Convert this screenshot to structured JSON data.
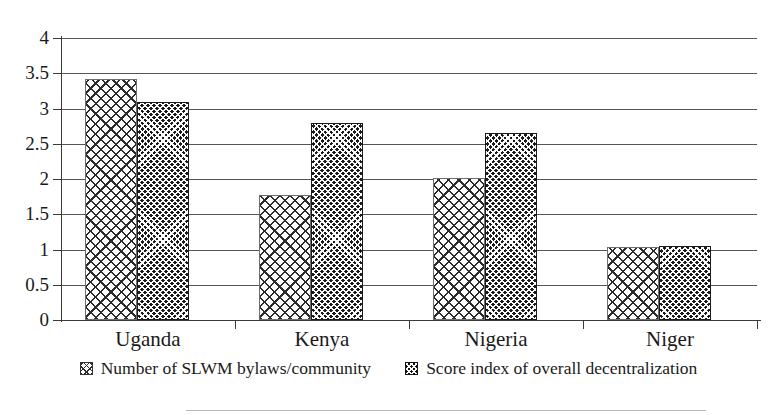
{
  "chart_data": {
    "type": "bar",
    "title": "",
    "xlabel": "",
    "ylabel": "",
    "categories": [
      "Uganda",
      "Kenya",
      "Nigeria",
      "Niger"
    ],
    "series": [
      {
        "name": "Number of SLWM bylaws/community",
        "pattern": "light-diagonal-crosshatch",
        "values": [
          3.42,
          1.77,
          2.02,
          1.04
        ]
      },
      {
        "name": "Score index of overall decentralization",
        "pattern": "dark-dense-checker",
        "values": [
          3.09,
          2.8,
          2.65,
          1.05
        ]
      }
    ],
    "ylim": [
      0,
      4
    ],
    "ytick_values": [
      0,
      0.5,
      1,
      1.5,
      2,
      2.5,
      3,
      3.5,
      4
    ],
    "ytick_labels": [
      "0",
      "0.5",
      "1",
      "1.5",
      "2",
      "2.5",
      "3",
      "3.5",
      "4"
    ],
    "grid": "horizontal",
    "legend_position": "bottom-center",
    "colors": {
      "series1_fill": "#ffffff",
      "series1_hatch": "#2b2b2b",
      "series2_fill": "#1b1b1b",
      "series2_hatch": "#ffffff",
      "axis": "#3a3a3a",
      "gridline": "#555555",
      "text": "#1a1a1a",
      "background": "#ffffff"
    }
  },
  "legend": {
    "items": [
      {
        "label": "Number of SLWM bylaws/community"
      },
      {
        "label": "Score index of overall decentralization"
      }
    ]
  }
}
